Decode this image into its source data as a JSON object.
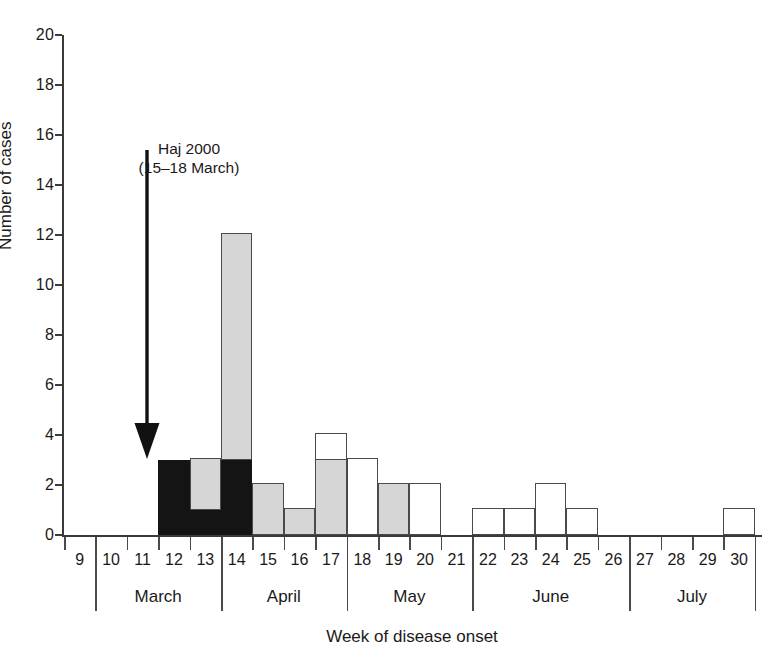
{
  "figure": {
    "cut_title": "",
    "xlabel": "Week of disease onset",
    "ylabel": "Number of cases"
  },
  "annotation": {
    "line1": "Haj 2000",
    "line2": "(15–18 March)",
    "arrow_name": "haj-2000-arrow"
  },
  "chart_data": {
    "type": "bar",
    "title": "",
    "xlabel": "Week of disease onset",
    "ylabel": "Number of cases",
    "ylim": [
      0,
      20
    ],
    "yticks": [
      0,
      2,
      4,
      6,
      8,
      10,
      12,
      14,
      16,
      18,
      20
    ],
    "ytick_labels": [
      "0",
      "2",
      "4",
      "6",
      "8",
      "10",
      "12",
      "14",
      "16",
      "18",
      "20"
    ],
    "grid": false,
    "legend": null,
    "stacked": true,
    "categories": [
      "9",
      "10",
      "11",
      "12",
      "13",
      "14",
      "15",
      "16",
      "17",
      "18",
      "19",
      "20",
      "21",
      "22",
      "23",
      "24",
      "25",
      "26",
      "27",
      "28",
      "29",
      "30"
    ],
    "xtick_labels": [
      "9",
      "10",
      "11",
      "12",
      "13",
      "14",
      "15",
      "16",
      "17",
      "18",
      "19",
      "20",
      "21",
      "22",
      "23",
      "24",
      "25",
      "26",
      "27",
      "28",
      "29",
      "30"
    ],
    "month_groups": [
      {
        "label": "March",
        "weeks": [
          "10",
          "11",
          "12",
          "13"
        ]
      },
      {
        "label": "April",
        "weeks": [
          "14",
          "15",
          "16",
          "17"
        ]
      },
      {
        "label": "May",
        "weeks": [
          "18",
          "19",
          "20",
          "21"
        ]
      },
      {
        "label": "June",
        "weeks": [
          "22",
          "23",
          "24",
          "25",
          "26"
        ]
      },
      {
        "label": "July",
        "weeks": [
          "27",
          "28",
          "29",
          "30"
        ]
      }
    ],
    "series": [
      {
        "name": "black",
        "color": "#141414",
        "values": [
          0,
          0,
          0,
          3,
          1,
          3,
          0,
          0,
          0,
          0,
          0,
          0,
          0,
          0,
          0,
          0,
          0,
          0,
          0,
          0,
          0,
          0
        ]
      },
      {
        "name": "gray",
        "color": "#d6d6d6",
        "values": [
          0,
          0,
          0,
          0,
          2,
          9,
          2,
          1,
          3,
          0,
          2,
          0,
          0,
          0,
          0,
          0,
          0,
          0,
          0,
          0,
          0,
          0
        ]
      },
      {
        "name": "white",
        "color": "#ffffff",
        "values": [
          0,
          0,
          0,
          0,
          0,
          0,
          0,
          0,
          1,
          3,
          0,
          2,
          0,
          1,
          1,
          2,
          1,
          0,
          0,
          0,
          0,
          1
        ]
      }
    ],
    "totals": [
      0,
      0,
      0,
      3,
      3,
      12,
      2,
      1,
      4,
      3,
      2,
      2,
      0,
      1,
      1,
      2,
      1,
      0,
      0,
      0,
      0,
      1
    ]
  },
  "colors": {
    "black_fill": "#141414",
    "gray_fill": "#d6d6d6",
    "white_fill": "#ffffff",
    "stroke": "#4a4a4a",
    "axis": "#3a3a3a",
    "background": "#ffffff"
  }
}
